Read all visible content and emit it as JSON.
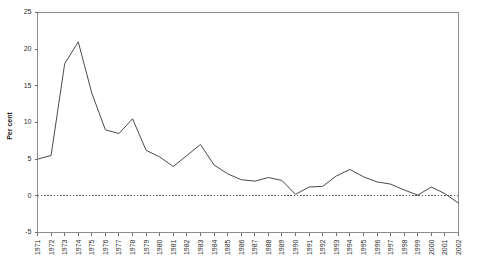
{
  "chart_data": {
    "type": "line",
    "title": "",
    "subtitle": "",
    "xlabel": "",
    "ylabel": "Per cent",
    "ylim": [
      -5,
      25
    ],
    "xlim": [
      1971,
      2002
    ],
    "yticks": [
      -5,
      0,
      5,
      10,
      15,
      20,
      25
    ],
    "ytick_labels": [
      "-5",
      "0",
      "5",
      "10",
      "15",
      "20",
      "25"
    ],
    "grid": false,
    "legend": "none",
    "zero_reference_line": true,
    "zero_reference_value": 0,
    "x": [
      1971,
      1972,
      1973,
      1974,
      1975,
      1976,
      1977,
      1978,
      1979,
      1980,
      1981,
      1982,
      1983,
      1984,
      1985,
      1986,
      1987,
      1988,
      1989,
      1990,
      1991,
      1992,
      1993,
      1994,
      1995,
      1996,
      1997,
      1998,
      1999,
      2000,
      2001,
      2002
    ],
    "categories": [
      "1971",
      "1972",
      "1973",
      "1974",
      "1975",
      "1976",
      "1977",
      "1978",
      "1979",
      "1980",
      "1981",
      "1982",
      "1983",
      "1984",
      "1985",
      "1986",
      "1987",
      "1988",
      "1989",
      "1990",
      "1991",
      "1992",
      "1993",
      "1994",
      "1995",
      "1996",
      "1997",
      "1998",
      "1999",
      "2000",
      "2001",
      "2002"
    ],
    "series": [
      {
        "name": "Per cent",
        "values": [
          5.0,
          5.5,
          18.0,
          21.0,
          14.0,
          9.0,
          8.5,
          10.5,
          6.2,
          5.3,
          4.0,
          5.5,
          7.0,
          4.2,
          3.0,
          2.2,
          2.0,
          2.5,
          2.1,
          0.2,
          1.2,
          1.3,
          2.7,
          3.6,
          2.6,
          1.9,
          1.6,
          0.8,
          0.1,
          1.2,
          0.3,
          -1.0
        ]
      }
    ]
  }
}
